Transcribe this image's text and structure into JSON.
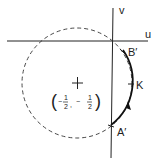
{
  "diagram": {
    "axes": {
      "horizontal_label": "u",
      "vertical_label": "v"
    },
    "circle": {
      "style": "dashed",
      "center_label": "(−½, −½)",
      "center_x_num": "1",
      "center_x_den": "2",
      "center_y_num": "1",
      "center_y_den": "2",
      "center_sign": "−"
    },
    "arc": {
      "style": "solid",
      "direction": "from A′ through K to B′ (upward arrow)"
    },
    "points": [
      {
        "label": "B′"
      },
      {
        "label": "K"
      },
      {
        "label": "A′"
      }
    ],
    "colors": {
      "line": "#222222",
      "background": "#ffffff"
    }
  }
}
